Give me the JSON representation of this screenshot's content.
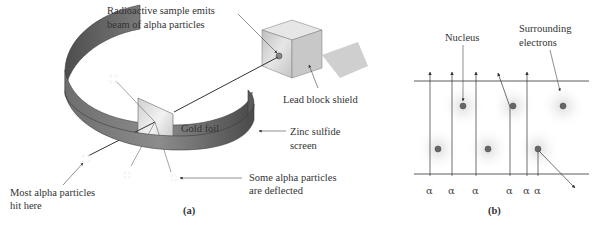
{
  "figure": {
    "panel_a": {
      "caption": "(a)",
      "labels": {
        "source_line1": "Radioactive sample emits",
        "source_line2": "beam of alpha particles",
        "shield": "Lead block shield",
        "foil": "Gold foil",
        "screen_line1": "Zinc sulfide",
        "screen_line2": "screen",
        "deflected_line1": "Some alpha particles",
        "deflected_line2": "are deflected",
        "most_line1": "Most alpha particles",
        "most_line2": "hit here"
      }
    },
    "panel_b": {
      "caption": "(b)",
      "labels": {
        "nucleus": "Nucleus",
        "electrons_line1": "Surrounding",
        "electrons_line2": "electrons"
      },
      "alpha_symbol": "α",
      "alpha_labels": [
        "α",
        "α",
        "α",
        "α",
        "α",
        "α"
      ]
    }
  },
  "colors": {
    "ring_dark": "#555555",
    "ring_light": "#8a8a8a",
    "box_front": "#d6d6d6",
    "box_top": "#e8e8e8",
    "box_side": "#b8b8b8",
    "shadow": "#cfcfcf",
    "foil": "#e4e4e4",
    "nucleus": "#666666",
    "line": "#333333"
  }
}
